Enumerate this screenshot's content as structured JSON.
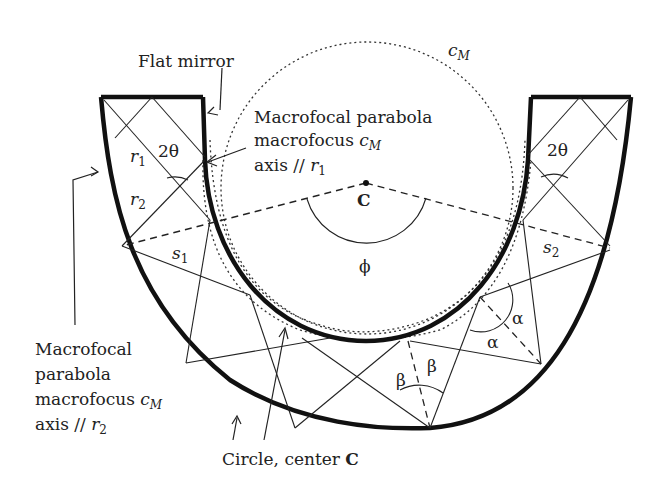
{
  "figure": {
    "type": "optical-concentrator-diagram"
  },
  "labels": {
    "flat_mirror": "Flat mirror",
    "mp1_line1": "Macrofocal parabola",
    "mp1_line2_prefix": "macrofocus ",
    "mp1_line2_var": "c",
    "mp1_line2_sub": "M",
    "mp1_line3_prefix": "axis // ",
    "mp1_line3_var": "r",
    "mp1_line3_sub": "1",
    "mp2_line1": "Macrofocal",
    "mp2_line2": "parabola",
    "mp2_line3_prefix": "macrofocus ",
    "mp2_line3_var": "c",
    "mp2_line3_sub": "M",
    "mp2_line4_prefix": "axis // ",
    "mp2_line4_var": "r",
    "mp2_line4_sub": "2",
    "circle_label_prefix": "Circle, center ",
    "circle_label_center": "C",
    "cm_var": "c",
    "cm_sub": "M",
    "center": "C",
    "phi": "ϕ",
    "two_theta_left": "2θ",
    "two_theta_right": "2θ",
    "r1_var": "r",
    "r1_sub": "1",
    "r2_var": "r",
    "r2_sub": "2",
    "s1_var": "s",
    "s1_sub": "1",
    "s2_var": "s",
    "s2_sub": "2",
    "alpha_1": "α",
    "alpha_2": "α",
    "beta_1": "β",
    "beta_2": "β"
  },
  "colors": {
    "stroke": "#111111",
    "text": "#222222",
    "background": "#ffffff"
  }
}
